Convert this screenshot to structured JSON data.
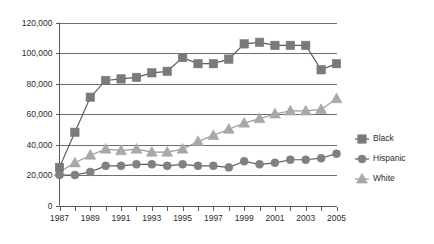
{
  "chart_data": {
    "type": "line",
    "title": "",
    "subtitle": "",
    "xlabel": "",
    "ylabel": "",
    "grid": true,
    "legend_position": "right",
    "xlim": [
      1987,
      2005
    ],
    "ylim": [
      0,
      120000
    ],
    "y_ticks": [
      0,
      20000,
      40000,
      60000,
      80000,
      100000,
      120000
    ],
    "y_tick_labels": [
      "0",
      "20,000",
      "40,000",
      "60,000",
      "80,000",
      "100,000",
      "120,000"
    ],
    "x": [
      1987,
      1988,
      1989,
      1990,
      1991,
      1992,
      1993,
      1994,
      1995,
      1996,
      1997,
      1998,
      1999,
      2000,
      2001,
      2002,
      2003,
      2004,
      2005
    ],
    "x_tick_labels": [
      "1987",
      "1989",
      "1991",
      "1993",
      "1995",
      "1997",
      "1999",
      "2001",
      "2003",
      "2005"
    ],
    "x_labeled_years": [
      1987,
      1989,
      1991,
      1993,
      1995,
      1997,
      1999,
      2001,
      2003,
      2005
    ],
    "series": [
      {
        "name": "Black",
        "marker": "square",
        "color": "#7a7a7a",
        "line_color": "#5c5c5c",
        "values": [
          25000,
          48000,
          71000,
          82000,
          83000,
          84000,
          87000,
          88000,
          97000,
          93000,
          93000,
          96000,
          106000,
          107000,
          105000,
          105000,
          105000,
          89000,
          93000
        ]
      },
      {
        "name": "Hispanic",
        "marker": "circle",
        "color": "#808080",
        "line_color": "#5c5c5c",
        "values": [
          20000,
          20000,
          22000,
          26000,
          26000,
          27000,
          27000,
          26000,
          27000,
          26000,
          26000,
          25000,
          29000,
          27000,
          28000,
          30000,
          30000,
          31000,
          34000
        ]
      },
      {
        "name": "White",
        "marker": "triangle",
        "color": "#a8a8a8",
        "line_color": "#9a9a9a",
        "values": [
          22000,
          28000,
          33000,
          37000,
          36000,
          37000,
          35000,
          35000,
          37000,
          42000,
          46000,
          50000,
          54000,
          57000,
          60000,
          62000,
          62000,
          63000,
          70000
        ]
      }
    ]
  },
  "legend": {
    "items": [
      {
        "label": "Black"
      },
      {
        "label": "Hispanic"
      },
      {
        "label": "White"
      }
    ]
  },
  "colors": {
    "axis": "#5a5a5a",
    "grid": "#6e6e6e",
    "text": "#2b2b2b",
    "background": "#ffffff"
  }
}
